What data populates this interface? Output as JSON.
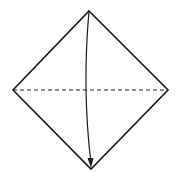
{
  "diagram": {
    "type": "origami-fold-instruction",
    "background": "#ffffff",
    "stroke_color": "#1a1a1a",
    "shape": {
      "name": "square-paper-diamond",
      "vertices": {
        "top": [
          89,
          11
        ],
        "right": [
          168,
          90
        ],
        "bottom": [
          91,
          169
        ],
        "left": [
          13,
          90
        ]
      }
    },
    "crease": {
      "style": "valley-fold-dashed",
      "from": [
        13,
        90
      ],
      "to": [
        168,
        90
      ]
    },
    "arrow": {
      "meaning": "fold-top-corner-down",
      "from": [
        89,
        11
      ],
      "to": [
        91,
        167
      ]
    }
  }
}
